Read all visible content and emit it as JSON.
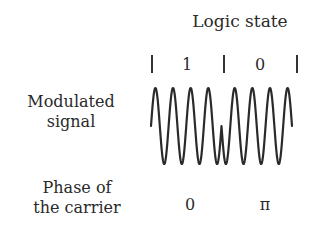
{
  "title": "Logic state",
  "logic_states": [
    {
      "label": "1",
      "x": 187
    },
    {
      "label": "0",
      "x": 260
    }
  ],
  "tick_marks_x": [
    152,
    224,
    297
  ],
  "left_labels": {
    "signal": [
      "Modulated",
      "signal"
    ],
    "phase": [
      "Phase of",
      "the carrier"
    ]
  },
  "phases": [
    {
      "label": "0",
      "x": 190
    },
    {
      "label": "π",
      "x": 265
    }
  ],
  "waveform": {
    "type": "BPSK",
    "cycles_per_bit": 4,
    "bits": [
      "1",
      "0"
    ],
    "stroke_color": "#2a2a2a"
  }
}
